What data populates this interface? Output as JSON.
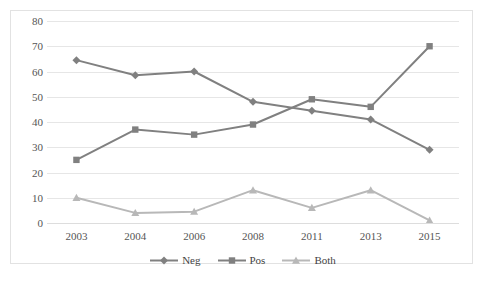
{
  "figure": {
    "title_remnant": "",
    "border_color": "#e2e2e2",
    "background": "#ffffff"
  },
  "axes": {
    "y_ticks": [
      "80",
      "70",
      "60",
      "50",
      "40",
      "30",
      "20",
      "10",
      "0"
    ],
    "x_ticks": [
      "2003",
      "2004",
      "2006",
      "2008",
      "2011",
      "2013",
      "2015"
    ]
  },
  "legend": {
    "items": [
      {
        "label": "Neg",
        "color": "#808080",
        "marker": "diamond"
      },
      {
        "label": "Pos",
        "color": "#808080",
        "marker": "square"
      },
      {
        "label": "Both",
        "color": "#b8b8b8",
        "marker": "triangle"
      }
    ]
  },
  "chart_data": {
    "type": "line",
    "title": "",
    "xlabel": "",
    "ylabel": "",
    "categories": [
      "2003",
      "2004",
      "2006",
      "2008",
      "2011",
      "2013",
      "2015"
    ],
    "ylim": [
      0,
      80
    ],
    "ytick_step": 10,
    "grid": true,
    "legend_position": "bottom",
    "series": [
      {
        "name": "Neg",
        "color": "#808080",
        "marker": "diamond",
        "values": [
          64.5,
          58.5,
          60,
          48,
          44.5,
          41,
          29
        ]
      },
      {
        "name": "Pos",
        "color": "#808080",
        "marker": "square",
        "values": [
          25,
          37,
          35,
          39,
          49,
          46,
          70
        ]
      },
      {
        "name": "Both",
        "color": "#b8b8b8",
        "marker": "triangle",
        "values": [
          10,
          4,
          4.5,
          13,
          6,
          13,
          1
        ]
      }
    ]
  }
}
